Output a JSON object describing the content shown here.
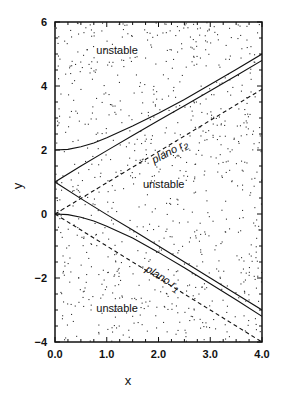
{
  "chart_data": {
    "type": "line",
    "title": "",
    "xlabel": "x",
    "ylabel": "y",
    "xlim": [
      0.0,
      4.0
    ],
    "ylim": [
      -4,
      6
    ],
    "xticks": [
      0.0,
      1.0,
      2.0,
      3.0,
      4.0
    ],
    "xtick_labels": [
      "0.0",
      "1.0",
      "2.0",
      "3.0",
      "4.0"
    ],
    "yticks": [
      -4,
      -2,
      0,
      2,
      4,
      6
    ],
    "ytick_labels": [
      "-4",
      "-2",
      "0",
      "2",
      "4",
      "6"
    ],
    "grid": false,
    "legend": "none",
    "background_pattern": "stippled dots (unstable regions)",
    "series": [
      {
        "name": "upper boundary (outer)",
        "style": "solid",
        "x": [
          0.0,
          0.25,
          0.5,
          0.75,
          1.0,
          1.5,
          2.0,
          2.5,
          3.0,
          3.5,
          4.0
        ],
        "y": [
          2.0,
          2.02,
          2.1,
          2.22,
          2.38,
          2.75,
          3.15,
          3.58,
          4.05,
          4.52,
          5.0
        ]
      },
      {
        "name": "upper boundary (inner)",
        "style": "solid",
        "x": [
          0.0,
          0.5,
          1.0,
          1.5,
          2.0,
          2.5,
          3.0,
          3.5,
          4.0
        ],
        "y": [
          1.0,
          1.5,
          1.98,
          2.45,
          2.92,
          3.38,
          3.85,
          4.32,
          4.8
        ]
      },
      {
        "name": "plano r2",
        "style": "dashed",
        "x": [
          0.0,
          4.0
        ],
        "y": [
          0.0,
          3.9
        ]
      },
      {
        "name": "lower boundary (inner)",
        "style": "solid",
        "x": [
          0.0,
          0.5,
          1.0,
          1.5,
          2.0,
          2.5,
          3.0,
          3.5,
          4.0
        ],
        "y": [
          1.0,
          0.48,
          -0.02,
          -0.5,
          -1.0,
          -1.5,
          -2.0,
          -2.5,
          -3.0
        ]
      },
      {
        "name": "lower boundary (outer)",
        "style": "solid",
        "x": [
          0.0,
          0.25,
          0.5,
          0.75,
          1.0,
          1.5,
          2.0,
          2.5,
          3.0,
          3.5,
          4.0
        ],
        "y": [
          0.0,
          -0.02,
          -0.1,
          -0.22,
          -0.38,
          -0.75,
          -1.2,
          -1.68,
          -2.18,
          -2.68,
          -3.2
        ]
      },
      {
        "name": "plano r1",
        "style": "dashed",
        "x": [
          0.0,
          4.0
        ],
        "y": [
          0.0,
          -4.0
        ]
      }
    ],
    "annotations": [
      {
        "text": "unstable",
        "x": 1.2,
        "y": 5.0,
        "kind": "region"
      },
      {
        "text": "unstable",
        "x": 2.1,
        "y": 0.8,
        "kind": "region"
      },
      {
        "text": "unstable",
        "x": 1.2,
        "y": -3.05,
        "kind": "region"
      },
      {
        "text": "plano r",
        "sub": "2",
        "x": 2.25,
        "y": 1.85,
        "angle": -28,
        "kind": "plane"
      },
      {
        "text": "plano r",
        "sub": "1",
        "x": 2.05,
        "y": -2.1,
        "angle": 32,
        "kind": "plane"
      }
    ]
  },
  "colors": {
    "ink": "#111111",
    "background": "#ffffff",
    "stipple": "#333333"
  }
}
